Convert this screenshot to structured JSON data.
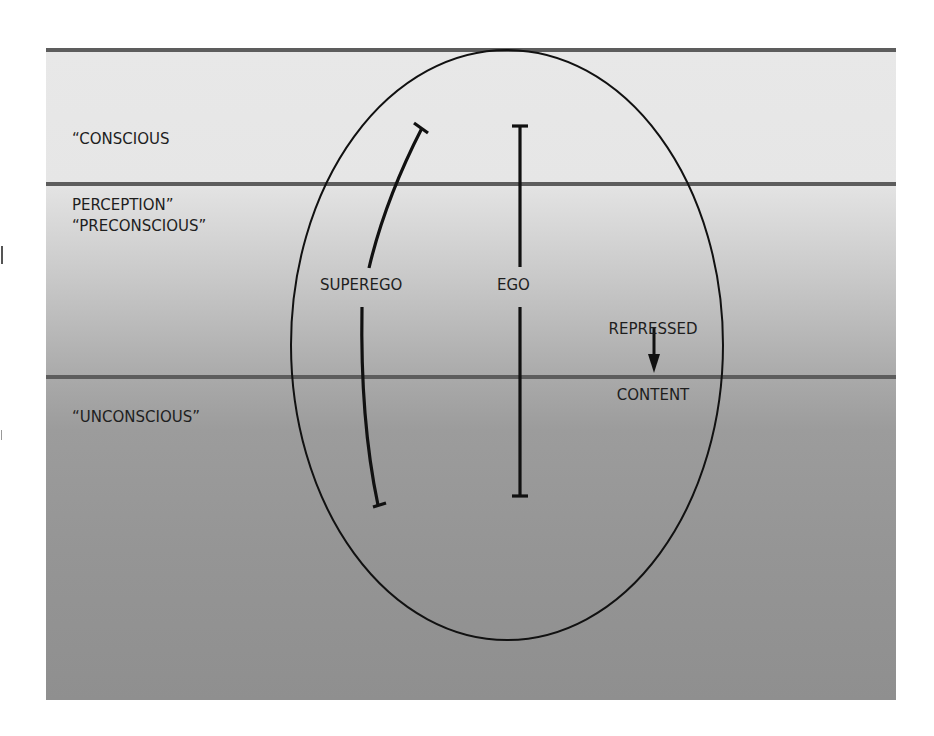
{
  "diagram": {
    "type": "topographic-structural-model",
    "zones": [
      {
        "id": "conscious",
        "label_line1": "“CONSCIOUS",
        "label_line2": "PERCEPTION”"
      },
      {
        "id": "preconscious",
        "label": "“PRECONSCIOUS”"
      },
      {
        "id": "unconscious",
        "label": "“UNCONSCIOUS”"
      }
    ],
    "structures": {
      "superego": "SUPEREGO",
      "ego": "EGO",
      "repressed_line1": "REPRESSED",
      "repressed_line2": "CONTENT"
    },
    "colors": {
      "zone_line": "#5d5d5d",
      "ink": "#111111",
      "top_fill": "#e6e6e6",
      "bottom_fill": "#8f8f8f"
    }
  }
}
